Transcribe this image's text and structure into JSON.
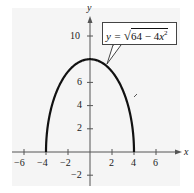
{
  "chart_data": {
    "type": "line",
    "title": "",
    "xlabel": "x",
    "ylabel": "y",
    "xlim": [
      -7,
      7
    ],
    "ylim": [
      -3,
      11
    ],
    "grid": false,
    "x_ticks": [
      -6,
      -4,
      -2,
      2,
      4,
      6
    ],
    "y_ticks": [
      -2,
      2,
      4,
      6,
      10
    ],
    "series": [
      {
        "name": "y = sqrt(64 - 4x^2)",
        "equation": "y = √(64 − 4x²)",
        "domain": [
          -4,
          4
        ],
        "x": [
          -4,
          -3.5,
          -3,
          -2.5,
          -2,
          -1.5,
          -1,
          -0.5,
          0,
          0.5,
          1,
          1.5,
          2,
          2.5,
          3,
          3.5,
          4
        ],
        "y": [
          0,
          3.87,
          5.29,
          6.24,
          6.93,
          7.42,
          7.75,
          7.94,
          8,
          7.94,
          7.75,
          7.42,
          6.93,
          6.24,
          5.29,
          3.87,
          0
        ],
        "color": "#111111"
      }
    ],
    "annotations": [
      {
        "text": "y = √(64 − 4x²)",
        "type": "callout-box",
        "points_to": [
          1.8,
          7.1
        ]
      }
    ]
  },
  "labels": {
    "x_axis": "x",
    "y_axis": "y",
    "x_ticks": [
      "−6",
      "−4",
      "−2",
      "2",
      "4",
      "6"
    ],
    "y_ticks": [
      "10",
      "6",
      "4",
      "2",
      "−2"
    ],
    "equation_lhs": "y = ",
    "equation_radicand": "64 − 4",
    "equation_var": "x",
    "equation_exp": "2"
  }
}
